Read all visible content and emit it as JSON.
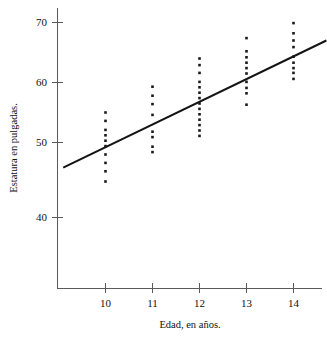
{
  "chart_data": {
    "type": "scatter",
    "title": "",
    "xlabel": "Edad, en años.",
    "ylabel": "Estatura en pulgadas.",
    "xlim": [
      9.1,
      14.75
    ],
    "ylim": [
      33.0,
      71.5
    ],
    "xticks": [
      10,
      11,
      12,
      13,
      14
    ],
    "xtick_labels": [
      "10",
      "11",
      "12",
      "13",
      "14"
    ],
    "yticks": [
      40,
      50,
      60,
      70
    ],
    "ytick_labels": [
      "40",
      "50",
      "60",
      "70"
    ],
    "grid": false,
    "legend": null,
    "point_color": "#1a1a1a",
    "line_color": "#141414",
    "axis_color": "#5a5a5a",
    "background_color": "#ffffff",
    "series": [
      {
        "name": "Estatura observada",
        "type": "scatter",
        "points": [
          {
            "x": 10,
            "y": 43.5
          },
          {
            "x": 10,
            "y": 45.2
          },
          {
            "x": 10,
            "y": 46.6
          },
          {
            "x": 10,
            "y": 48.0
          },
          {
            "x": 10,
            "y": 49.4
          },
          {
            "x": 10,
            "y": 50.3
          },
          {
            "x": 10,
            "y": 51.2
          },
          {
            "x": 10,
            "y": 52.1
          },
          {
            "x": 10,
            "y": 53.6
          },
          {
            "x": 10,
            "y": 55.0
          },
          {
            "x": 11,
            "y": 48.4
          },
          {
            "x": 11,
            "y": 49.3
          },
          {
            "x": 11,
            "y": 50.9
          },
          {
            "x": 11,
            "y": 51.8
          },
          {
            "x": 11,
            "y": 54.6
          },
          {
            "x": 11,
            "y": 56.4
          },
          {
            "x": 11,
            "y": 57.8
          },
          {
            "x": 11,
            "y": 59.3
          },
          {
            "x": 12,
            "y": 51.1
          },
          {
            "x": 12,
            "y": 52.0
          },
          {
            "x": 12,
            "y": 52.9
          },
          {
            "x": 12,
            "y": 53.8
          },
          {
            "x": 12,
            "y": 54.7
          },
          {
            "x": 12,
            "y": 55.6
          },
          {
            "x": 12,
            "y": 56.5
          },
          {
            "x": 12,
            "y": 57.4
          },
          {
            "x": 12,
            "y": 58.3
          },
          {
            "x": 12,
            "y": 59.2
          },
          {
            "x": 12,
            "y": 60.1
          },
          {
            "x": 12,
            "y": 61.6
          },
          {
            "x": 12,
            "y": 62.9
          },
          {
            "x": 12,
            "y": 64.0
          },
          {
            "x": 13,
            "y": 56.3
          },
          {
            "x": 13,
            "y": 58.2
          },
          {
            "x": 13,
            "y": 59.1
          },
          {
            "x": 13,
            "y": 60.1
          },
          {
            "x": 13,
            "y": 61.5
          },
          {
            "x": 13,
            "y": 62.4
          },
          {
            "x": 13,
            "y": 63.3
          },
          {
            "x": 13,
            "y": 64.2
          },
          {
            "x": 13,
            "y": 65.2
          },
          {
            "x": 13,
            "y": 67.4
          },
          {
            "x": 14,
            "y": 60.6
          },
          {
            "x": 14,
            "y": 61.6
          },
          {
            "x": 14,
            "y": 62.4
          },
          {
            "x": 14,
            "y": 63.3
          },
          {
            "x": 14,
            "y": 64.3
          },
          {
            "x": 14,
            "y": 65.9
          },
          {
            "x": 14,
            "y": 67.0
          },
          {
            "x": 14,
            "y": 68.2
          },
          {
            "x": 14,
            "y": 69.9
          }
        ]
      },
      {
        "name": "Recta de regresión",
        "type": "line",
        "endpoints": [
          {
            "x": 9.1,
            "y": 45.8
          },
          {
            "x": 14.7,
            "y": 67.0
          }
        ]
      }
    ]
  }
}
